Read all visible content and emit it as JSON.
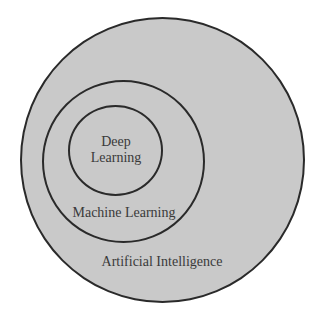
{
  "diagram": {
    "type": "nested-venn",
    "colors": {
      "fill": "#c9c9c9",
      "stroke": "#2a2a2a",
      "text": "#3a3a3a",
      "background": "#ffffff"
    },
    "sets": [
      {
        "id": "ai",
        "label": "Artificial Intelligence",
        "level": 0
      },
      {
        "id": "ml",
        "label": "Machine Learning",
        "level": 1,
        "contained_in": "ai"
      },
      {
        "id": "dl",
        "label_line1": "Deep",
        "label_line2": "Learning",
        "label": "Deep Learning",
        "level": 2,
        "contained_in": "ml"
      }
    ]
  }
}
